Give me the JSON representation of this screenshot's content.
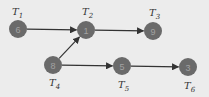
{
  "diagram": {
    "type": "task-dependency-graph",
    "colors": {
      "background": "#ececec",
      "node_fill": "#6a6a6a",
      "node_text": "#a2a2a2",
      "edge": "#333333"
    },
    "nodes": [
      {
        "id": "T1",
        "label_base": "T",
        "label_sub": "1",
        "value": "6",
        "cx": 18,
        "cy": 29,
        "lx": 12,
        "ly": 15
      },
      {
        "id": "T2",
        "label_base": "T",
        "label_sub": "2",
        "value": "1",
        "cx": 86,
        "cy": 30,
        "lx": 82,
        "ly": 15
      },
      {
        "id": "T3",
        "label_base": "T",
        "label_sub": "3",
        "value": "9",
        "cx": 153,
        "cy": 31,
        "lx": 149,
        "ly": 16
      },
      {
        "id": "T4",
        "label_base": "T",
        "label_sub": "4",
        "value": "8",
        "cx": 53,
        "cy": 65,
        "lx": 49,
        "ly": 86
      },
      {
        "id": "T5",
        "label_base": "T",
        "label_sub": "5",
        "value": "5",
        "cx": 122,
        "cy": 66,
        "lx": 118,
        "ly": 88
      },
      {
        "id": "T6",
        "label_base": "T",
        "label_sub": "6",
        "value": "3",
        "cx": 188,
        "cy": 67,
        "lx": 184,
        "ly": 89
      }
    ],
    "edges": [
      {
        "from": "T1",
        "to": "T2"
      },
      {
        "from": "T2",
        "to": "T3"
      },
      {
        "from": "T4",
        "to": "T2"
      },
      {
        "from": "T4",
        "to": "T5"
      },
      {
        "from": "T5",
        "to": "T6"
      }
    ]
  }
}
